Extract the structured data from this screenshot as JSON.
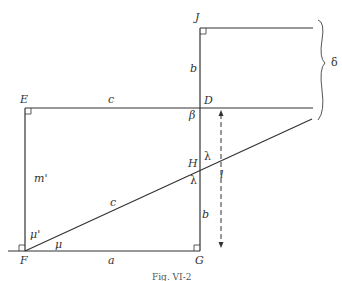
{
  "diagram": {
    "caption": "Fig. VI-2",
    "colors": {
      "line": "#333333",
      "background": "#ffffff"
    },
    "points": {
      "E": "E",
      "D": "D",
      "J": "J",
      "F": "F",
      "G": "G",
      "H": "H"
    },
    "segments": {
      "ED": "c",
      "JD": "b",
      "EF": "m'",
      "FH": "c",
      "HG": "b",
      "FG": "a"
    },
    "angles": {
      "at_D": "β",
      "above_H": "λ",
      "below_H": "λ",
      "at_F_upper": "μ'",
      "at_F_lower": "μ"
    },
    "dimensions": {
      "dashed_arrow": "l",
      "brace": "δ"
    }
  }
}
